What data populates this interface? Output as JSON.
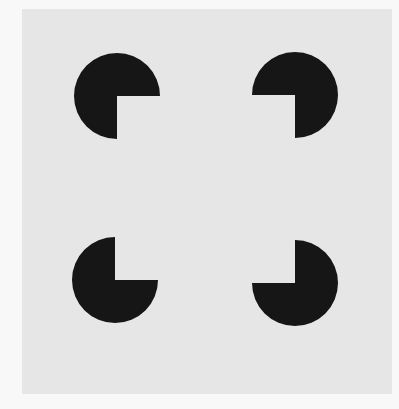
{
  "figure": {
    "canvas": {
      "width": 399,
      "height": 409,
      "background": "#f8f8f8"
    },
    "panel": {
      "x": 22,
      "y": 9,
      "width": 370,
      "height": 385,
      "fill": "#e6e6e6"
    },
    "inducer_color": "#161616",
    "inducers": [
      {
        "name": "top-left",
        "cx": 117,
        "cy": 96,
        "r": 43,
        "notch": "bottom-right"
      },
      {
        "name": "top-right",
        "cx": 295,
        "cy": 95,
        "r": 43,
        "notch": "bottom-left"
      },
      {
        "name": "bottom-left",
        "cx": 115,
        "cy": 280,
        "r": 43,
        "notch": "top-right"
      },
      {
        "name": "bottom-right",
        "cx": 295,
        "cy": 283,
        "r": 43,
        "notch": "top-left"
      }
    ]
  }
}
